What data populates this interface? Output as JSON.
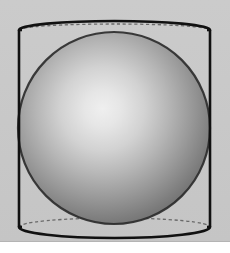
{
  "figure": {
    "caption_fragment": "",
    "background_color": "#c9c9c9",
    "page_color": "#ffffff",
    "stroke_color": "#111111",
    "dashed_stroke_color": "#555555",
    "solid_stroke_width": 2.6,
    "dashed_stroke_width": 1.4,
    "background_band": {
      "label": "gray figure panel",
      "x": 0,
      "y": 0,
      "width": 230,
      "height": 242
    },
    "cylinder": {
      "label": "cylinder",
      "left_edge_x": 19,
      "right_edge_x": 210,
      "top_center_y": 30,
      "bottom_center_y": 227,
      "radius_x": 95.5,
      "radius_y": 10.5,
      "top_front_arc_peak_y": 21,
      "top_back_arc_y": 24,
      "bottom_back_arc_y": 218,
      "bottom_front_arc_dip_y": 238
    },
    "sphere": {
      "label": "sphere",
      "center_x": 114,
      "center_y": 128,
      "radius": 96,
      "highlight_x": 103,
      "highlight_y": 116,
      "highlight_color": "#ededed",
      "mid_color": "#9a9a9a",
      "shadow_color": "#4d4d4d",
      "edge_color": "#3f3f3f"
    },
    "top_ghost_text": "· ·· ··· ···· ·· ····· ··· ·· ···· ·· ····· ···· ·· ·· ···· ··· ··"
  }
}
